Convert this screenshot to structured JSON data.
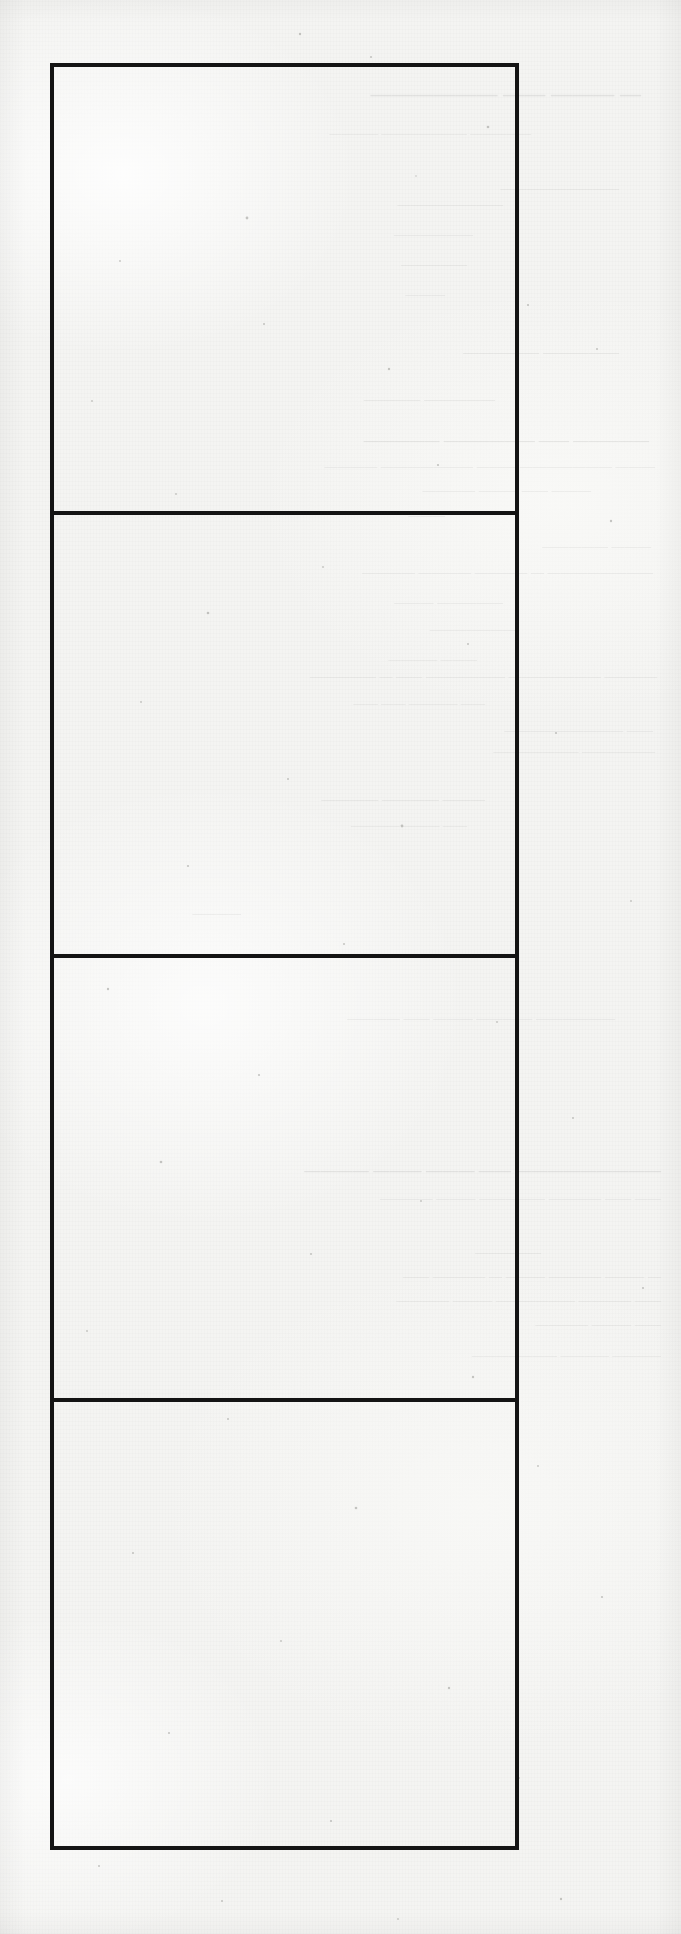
{
  "document": {
    "kind": "scanned-paper-sheet",
    "surface_color": "#f4f4f2",
    "ink_color": "#141414",
    "page_width": 681,
    "page_height": 1934,
    "visible_printed_text": ""
  },
  "form_box": {
    "left": 50,
    "top": 63,
    "width": 469,
    "height": 1787,
    "border_width": 4,
    "cells": [
      {
        "label": "",
        "height": 448,
        "rule_below": true
      },
      {
        "label": "",
        "height": 443,
        "rule_below": true
      },
      {
        "label": "",
        "height": 444,
        "rule_below": true
      },
      {
        "label": "",
        "height": 444,
        "rule_below": false
      }
    ]
  },
  "bleed_through": {
    "note": "faint mirrored show-through text from the reverse of the sheet; illegible on the scan",
    "lines": [
      {
        "top": 82,
        "left": 40,
        "size": 21,
        "weight": "700",
        "text": "— ——— ——  ——————"
      },
      {
        "top": 126,
        "left": 150,
        "size": 12,
        "weight": "400",
        "text": "—————  ———————  ————"
      },
      {
        "top": 180,
        "left": 62,
        "size": 13,
        "weight": "400",
        "text": "—————————"
      },
      {
        "top": 196,
        "left": 178,
        "size": 13,
        "weight": "400",
        "text": "————————"
      },
      {
        "top": 226,
        "left": 208,
        "size": 13,
        "weight": "400",
        "text": "——————"
      },
      {
        "top": 256,
        "left": 214,
        "size": 13,
        "weight": "400",
        "text": "—————"
      },
      {
        "top": 286,
        "left": 236,
        "size": 13,
        "weight": "400",
        "text": "———"
      },
      {
        "top": 344,
        "left": 62,
        "size": 15,
        "weight": "400",
        "text": "—————  —————"
      },
      {
        "top": 392,
        "left": 186,
        "size": 14,
        "weight": "400",
        "text": "—————  ————"
      },
      {
        "top": 432,
        "left": 32,
        "size": 15,
        "weight": "700",
        "text": "—————  ——  ——————  —————"
      },
      {
        "top": 458,
        "left": 26,
        "size": 13,
        "weight": "400",
        "text": "———  ———————  ———  ———————  ————"
      },
      {
        "top": 482,
        "left": 90,
        "size": 13,
        "weight": "400",
        "text": "———  ——  ———  ————"
      },
      {
        "top": 508,
        "left": 236,
        "size": 12,
        "weight": "400",
        "text": "———"
      },
      {
        "top": 538,
        "left": 30,
        "size": 13,
        "weight": "400",
        "text": "———  —————"
      },
      {
        "top": 564,
        "left": 28,
        "size": 13,
        "weight": "400",
        "text": "————————  —  ————  ————  ————"
      },
      {
        "top": 594,
        "left": 178,
        "size": 13,
        "weight": "400",
        "text": "—————  ———"
      },
      {
        "top": 622,
        "left": 166,
        "size": 12,
        "weight": "400",
        "text": "———————"
      },
      {
        "top": 652,
        "left": 204,
        "size": 12,
        "weight": "400",
        "text": "———  ————"
      },
      {
        "top": 668,
        "left": 24,
        "size": 13,
        "weight": "400",
        "text": "————  ———————   ——————  ——  —  —————"
      },
      {
        "top": 696,
        "left": 196,
        "size": 12,
        "weight": "400",
        "text": "——  ————  ——  ——"
      },
      {
        "top": 722,
        "left": 28,
        "size": 13,
        "weight": "400",
        "text": "——  —————————"
      },
      {
        "top": 744,
        "left": 26,
        "size": 12,
        "weight": "400",
        "text": "——————  ———————"
      },
      {
        "top": 792,
        "left": 196,
        "size": 14,
        "weight": "400",
        "text": "———  ————  ————"
      },
      {
        "top": 818,
        "left": 214,
        "size": 12,
        "weight": "400",
        "text": "——  ———  ————"
      },
      {
        "top": 906,
        "left": 440,
        "size": 12,
        "weight": "400",
        "text": "————"
      },
      {
        "top": 1010,
        "left": 66,
        "size": 13,
        "weight": "400",
        "text": "——————  —  ———  ———  ——  ————"
      },
      {
        "top": 1162,
        "left": 20,
        "size": 16,
        "weight": "700",
        "text": "—————————  ——  ———  ———  ————"
      },
      {
        "top": 1190,
        "left": 20,
        "size": 13,
        "weight": "400",
        "text": "——  ——  ————  —————  ———  ————"
      },
      {
        "top": 1244,
        "left": 140,
        "size": 13,
        "weight": "400",
        "text": "—————"
      },
      {
        "top": 1268,
        "left": 20,
        "size": 13,
        "weight": "400",
        "text": "—  ———  ————  ———  —  ————  ——"
      },
      {
        "top": 1292,
        "left": 20,
        "size": 13,
        "weight": "400",
        "text": "——  ————   ——————  ———  ————"
      },
      {
        "top": 1316,
        "left": 20,
        "size": 13,
        "weight": "400",
        "text": "——  ———  ————"
      },
      {
        "top": 1348,
        "left": 20,
        "size": 12,
        "weight": "400",
        "text": "————  ————  ———————"
      }
    ]
  }
}
